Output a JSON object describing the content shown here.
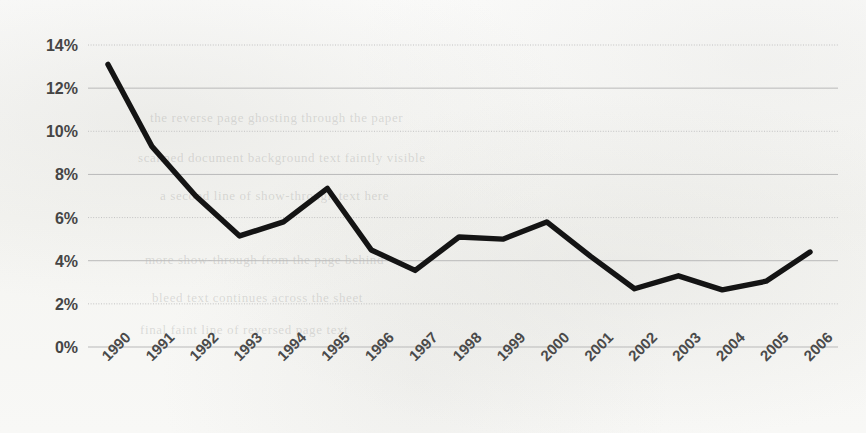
{
  "chart_data": {
    "type": "line",
    "title": "",
    "subtitle": "",
    "xlabel": "",
    "ylabel": "",
    "categories": [
      "1990",
      "1991",
      "1992",
      "1993",
      "1994",
      "1995",
      "1996",
      "1997",
      "1998",
      "1999",
      "2000",
      "2001",
      "2002",
      "2003",
      "2004",
      "2005",
      "2006"
    ],
    "values": [
      13.1,
      9.3,
      7.0,
      5.15,
      5.8,
      7.35,
      4.5,
      3.55,
      5.1,
      5.0,
      5.8,
      4.2,
      2.7,
      3.3,
      2.65,
      3.05,
      4.4
    ],
    "series": [
      {
        "name": "",
        "values": [
          13.1,
          9.3,
          7.0,
          5.15,
          5.8,
          7.35,
          4.5,
          3.55,
          5.1,
          5.0,
          5.8,
          4.2,
          2.7,
          3.3,
          2.65,
          3.05,
          4.4
        ]
      }
    ],
    "ylim": [
      0,
      14
    ],
    "ytick_values": [
      0,
      2,
      4,
      6,
      8,
      10,
      12,
      14
    ],
    "ytick_labels": [
      "0%",
      "2%",
      "4%",
      "6%",
      "8%",
      "10%",
      "12%",
      "14%"
    ],
    "grid": true,
    "grid_axis": "y",
    "legend": "none",
    "line_color": "#141414",
    "gridline_color": "#b9b9b9",
    "label_color": "#454545",
    "background_color": "#f7f7f5",
    "xtick_rotation": -45,
    "markers": false
  },
  "page_bleed": [
    "the reverse page ghosting through the paper",
    "scanned document background text faintly visible",
    "a second line of show-through text here",
    "more show-through from the page behind",
    "bleed text continues across the sheet",
    "final faint line of reversed page text"
  ]
}
